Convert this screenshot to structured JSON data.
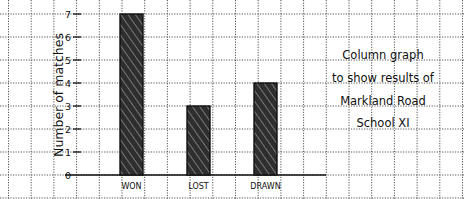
{
  "chart_data": {
    "type": "bar",
    "title_lines": [
      "Column graph",
      "to show results of",
      "Markland Road",
      "School XI"
    ],
    "xlabel": "",
    "ylabel": "Number of matches",
    "categories": [
      "WON",
      "LOST",
      "DRAWN"
    ],
    "values": [
      7,
      3,
      4
    ],
    "ylim": [
      0,
      7
    ],
    "yticks": [
      "0",
      "1",
      "2",
      "3",
      "4",
      "5",
      "6",
      "7"
    ],
    "grid": true,
    "legend": null,
    "bar_style": "hand-shaded dark grey with black outline"
  },
  "colors": {
    "bar_fill": "#3a3a3a",
    "bar_stroke": "#111111",
    "grid": "#555555",
    "axis": "#111111",
    "background": "#ffffff"
  }
}
